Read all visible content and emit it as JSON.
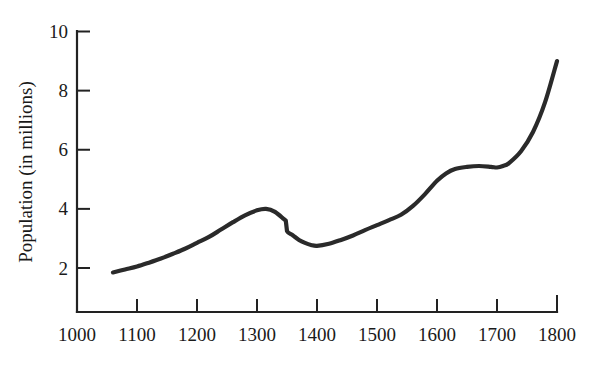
{
  "chart_data": {
    "type": "line",
    "title": "",
    "xlabel": "",
    "ylabel": "Population (in millions)",
    "xlim": [
      1000,
      1800
    ],
    "ylim": [
      0,
      10
    ],
    "xticks": [
      1000,
      1100,
      1200,
      1300,
      1400,
      1500,
      1600,
      1700,
      1800
    ],
    "yticks": [
      2,
      4,
      6,
      8,
      10
    ],
    "xtick_labels": [
      "1000",
      "1100",
      "1200",
      "1300",
      "1400",
      "1500",
      "1600",
      "1700",
      "1800"
    ],
    "ytick_labels": [
      "2",
      "4",
      "6",
      "8",
      "10"
    ],
    "grid": false,
    "legend": null,
    "series": [
      {
        "name": "Population",
        "color": "#2a2a2a",
        "x": [
          1060,
          1080,
          1100,
          1120,
          1140,
          1160,
          1180,
          1200,
          1220,
          1240,
          1260,
          1280,
          1300,
          1315,
          1330,
          1345,
          1348,
          1350,
          1360,
          1370,
          1380,
          1390,
          1400,
          1420,
          1440,
          1460,
          1480,
          1500,
          1520,
          1540,
          1560,
          1580,
          1600,
          1615,
          1630,
          1650,
          1670,
          1690,
          1700,
          1710,
          1720,
          1740,
          1760,
          1780,
          1800
        ],
        "y": [
          1.85,
          1.95,
          2.05,
          2.18,
          2.32,
          2.48,
          2.65,
          2.85,
          3.05,
          3.3,
          3.55,
          3.78,
          3.95,
          4.0,
          3.9,
          3.65,
          3.6,
          3.25,
          3.1,
          2.95,
          2.85,
          2.78,
          2.75,
          2.82,
          2.95,
          3.1,
          3.28,
          3.45,
          3.62,
          3.8,
          4.1,
          4.5,
          4.95,
          5.2,
          5.35,
          5.42,
          5.45,
          5.42,
          5.4,
          5.45,
          5.55,
          5.95,
          6.6,
          7.6,
          9.0
        ]
      }
    ],
    "annotations": [
      {
        "label": "Black Death discontinuity",
        "x": 1348,
        "y_from": 3.6,
        "y_to": 3.25
      }
    ]
  },
  "axes": {
    "y_axis_label": "Population (in millions)"
  }
}
